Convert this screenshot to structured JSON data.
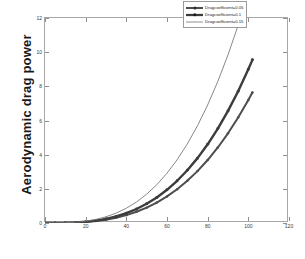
{
  "chart_data": {
    "type": "line",
    "title": "",
    "xlabel": "",
    "ylabel": "Aerodynamic drag power",
    "xlim": [
      0,
      120
    ],
    "ylim": [
      0,
      12
    ],
    "xticks": [
      0,
      20,
      40,
      60,
      80,
      100,
      120
    ],
    "yticks": [
      0,
      2,
      4,
      6,
      8,
      10,
      12
    ],
    "grid": false,
    "legend_position": "upper right",
    "x": [
      0,
      5,
      10,
      15,
      20,
      25,
      30,
      35,
      40,
      45,
      50,
      55,
      60,
      65,
      70,
      75,
      80,
      85,
      90,
      95,
      100,
      102
    ],
    "series": [
      {
        "name": "Drag coefficient 0.15",
        "label": "Dragcoefficient=0.15",
        "color": "#7a7a7a",
        "line_width": 0.9,
        "marker": "none",
        "values": [
          0,
          0.0017,
          0.0135,
          0.0455,
          0.108,
          0.2109,
          0.3645,
          0.5788,
          0.864,
          1.2302,
          1.6875,
          2.246,
          2.916,
          3.7074,
          4.6305,
          5.6953,
          6.912,
          8.2906,
          9.8415,
          11.5745,
          13.5,
          14.3242
        ]
      },
      {
        "name": "Drag coefficient 0.1",
        "label": "Dragcoefficient=0.1",
        "color": "#3c3c3c",
        "line_width": 2.4,
        "marker": "circle",
        "values": [
          0,
          0.0011,
          0.009,
          0.0304,
          0.072,
          0.1406,
          0.243,
          0.3859,
          0.576,
          0.8201,
          1.125,
          1.4974,
          1.944,
          2.4716,
          3.087,
          3.7969,
          4.608,
          5.5271,
          6.561,
          7.7164,
          9.0,
          9.5495
        ]
      },
      {
        "name": "Drag coefficient 0.05",
        "label": "Dragcoefficient=0.05",
        "color": "#4d4d4d",
        "line_width": 2.0,
        "marker": "circle",
        "values": [
          0,
          0.0009,
          0.0072,
          0.0243,
          0.0576,
          0.1125,
          0.1944,
          0.3087,
          0.4608,
          0.6561,
          0.9,
          1.1979,
          1.5552,
          1.9773,
          2.4696,
          3.0375,
          3.6864,
          4.4217,
          5.2488,
          6.1731,
          7.2,
          7.6396
        ]
      }
    ],
    "legend_entries": [
      "Dragcoefficient=0.05",
      "Dragcoefficient=0.1",
      "Dragcoefficient=0.15"
    ]
  }
}
